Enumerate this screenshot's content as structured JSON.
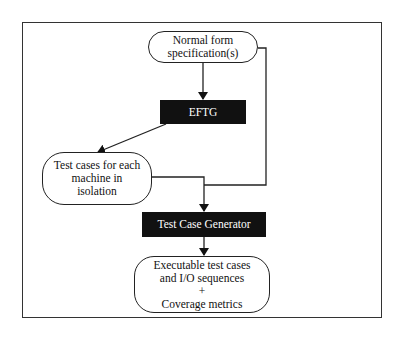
{
  "diagram": {
    "nodes": [
      {
        "id": "spec",
        "label": "Normal form\nspecification(s)",
        "shape": "rounded"
      },
      {
        "id": "eftg",
        "label": "EFTG",
        "shape": "filled-rect"
      },
      {
        "id": "isolated",
        "label": "Test cases for each\nmachine in\nisolation",
        "shape": "rounded"
      },
      {
        "id": "tcg",
        "label": "Test Case Generator",
        "shape": "filled-rect"
      },
      {
        "id": "output",
        "label": "Executable test cases\nand I/O sequences\n+\nCoverage metrics",
        "shape": "rounded"
      }
    ],
    "edges": [
      {
        "from": "spec",
        "to": "eftg"
      },
      {
        "from": "eftg",
        "to": "isolated"
      },
      {
        "from": "isolated",
        "to": "tcg"
      },
      {
        "from": "spec",
        "to": "tcg"
      },
      {
        "from": "tcg",
        "to": "output"
      }
    ],
    "colors": {
      "block_fill": "#111111",
      "block_text": "#ffffff",
      "line": "#222222"
    }
  }
}
